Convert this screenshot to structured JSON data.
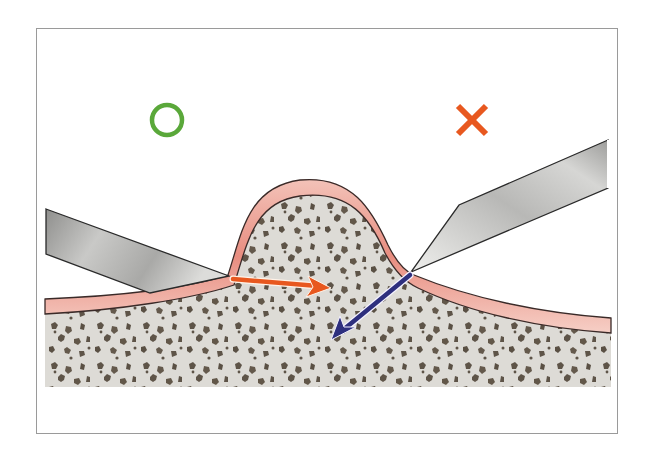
{
  "figure": {
    "panels": [
      {
        "id": "correct",
        "symbol": "circle",
        "meaning": "correct",
        "color": "#5aa83a"
      },
      {
        "id": "incorrect",
        "symbol": "cross",
        "meaning": "incorrect",
        "color": "#e8581f"
      }
    ],
    "elements": {
      "left_blade": {
        "label": "scalpel blade (correct angle)"
      },
      "right_blade": {
        "label": "scalpel blade (incorrect angle)"
      },
      "orange_arrow": {
        "label": "incision direction (correct)",
        "color": "#e8581f"
      },
      "navy_arrow": {
        "label": "incision direction (incorrect)",
        "color": "#2e2f7e"
      },
      "gingiva": {
        "label": "soft tissue layer",
        "color": "#e9978c"
      },
      "bone": {
        "label": "bone",
        "color": "#dcdad5",
        "pore_color": "#5e5448"
      }
    }
  },
  "colors": {
    "frame": "#9a9a9a",
    "blade_light": "#e8e8e6",
    "blade_dark": "#9a9a98",
    "outline": "#2a2a2a"
  }
}
